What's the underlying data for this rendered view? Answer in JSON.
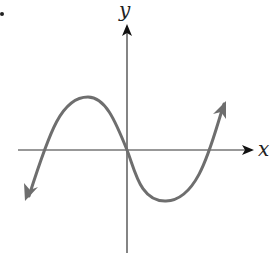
{
  "figure": {
    "type": "function-graph",
    "axes": {
      "x_label": "x",
      "y_label": "y",
      "axis_color": "#222222"
    },
    "curve": {
      "color": "#6e6e6e",
      "shape": "cubic",
      "end_behavior": "falls left, rises right",
      "features": {
        "local_max": "left of y-axis, above x-axis",
        "local_min": "right of y-axis, below x-axis",
        "zeros": [
          "negative x",
          "origin",
          "positive x"
        ]
      }
    },
    "marker": "•"
  }
}
